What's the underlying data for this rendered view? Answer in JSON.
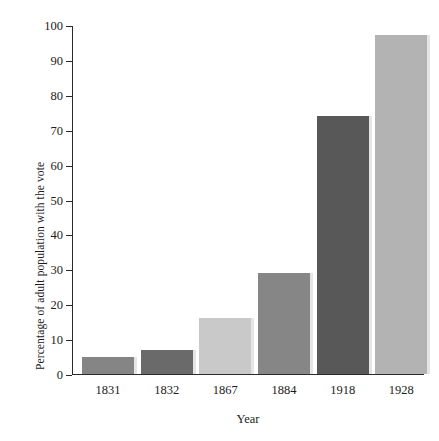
{
  "chart_data": {
    "type": "bar",
    "title": "",
    "subtitle": "",
    "xlabel": "Year",
    "ylabel": "Percentage of adult population with the vote",
    "categories": [
      "1831",
      "1832",
      "1867",
      "1884",
      "1918",
      "1928"
    ],
    "values": [
      5,
      7,
      16,
      29,
      74,
      97
    ],
    "bar_colors": [
      "#858585",
      "#6a6a6a",
      "#c9c9c9",
      "#868686",
      "#585858",
      "#b3b3b3"
    ],
    "ylim": [
      0,
      100
    ],
    "yticks": [
      0,
      10,
      20,
      30,
      40,
      50,
      60,
      70,
      80,
      90,
      100
    ],
    "ytick_labels": [
      "0",
      "10",
      "20",
      "30",
      "40",
      "50",
      "60",
      "70",
      "80",
      "90",
      "100"
    ],
    "grid": false,
    "legend": false,
    "axis_color": "#2a2a2a",
    "background": "#ffffff"
  }
}
